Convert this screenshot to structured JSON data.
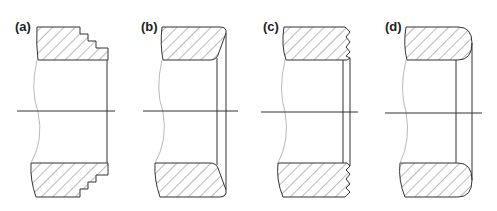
{
  "figure": {
    "panels": [
      {
        "id": "a",
        "label": "(a)",
        "edge_profile": "stepped"
      },
      {
        "id": "b",
        "label": "(b)",
        "edge_profile": "chamfered"
      },
      {
        "id": "c",
        "label": "(c)",
        "edge_profile": "serrated"
      },
      {
        "id": "d",
        "label": "(d)",
        "edge_profile": "rounded"
      }
    ]
  },
  "colors": {
    "line": "#333333",
    "hatch": "#555555",
    "break_line": "#999999",
    "background": "#ffffff"
  }
}
